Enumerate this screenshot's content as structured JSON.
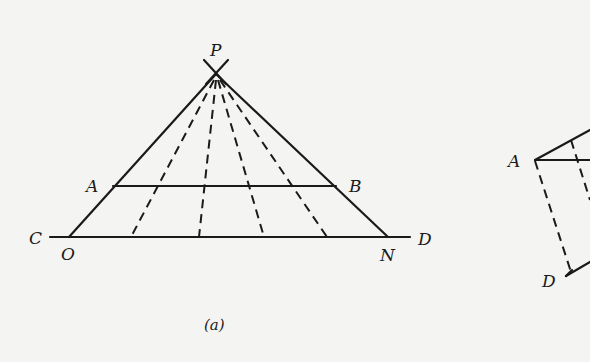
{
  "figure_a": {
    "caption": "(a)",
    "points": {
      "P": "P",
      "A": "A",
      "B": "B",
      "C": "C",
      "D": "D",
      "O": "O",
      "N": "N"
    }
  },
  "figure_b": {
    "points": {
      "A": "A",
      "D": "D"
    }
  },
  "colors": {
    "ink": "#1a1a1a",
    "paper": "#f4f4f2"
  }
}
